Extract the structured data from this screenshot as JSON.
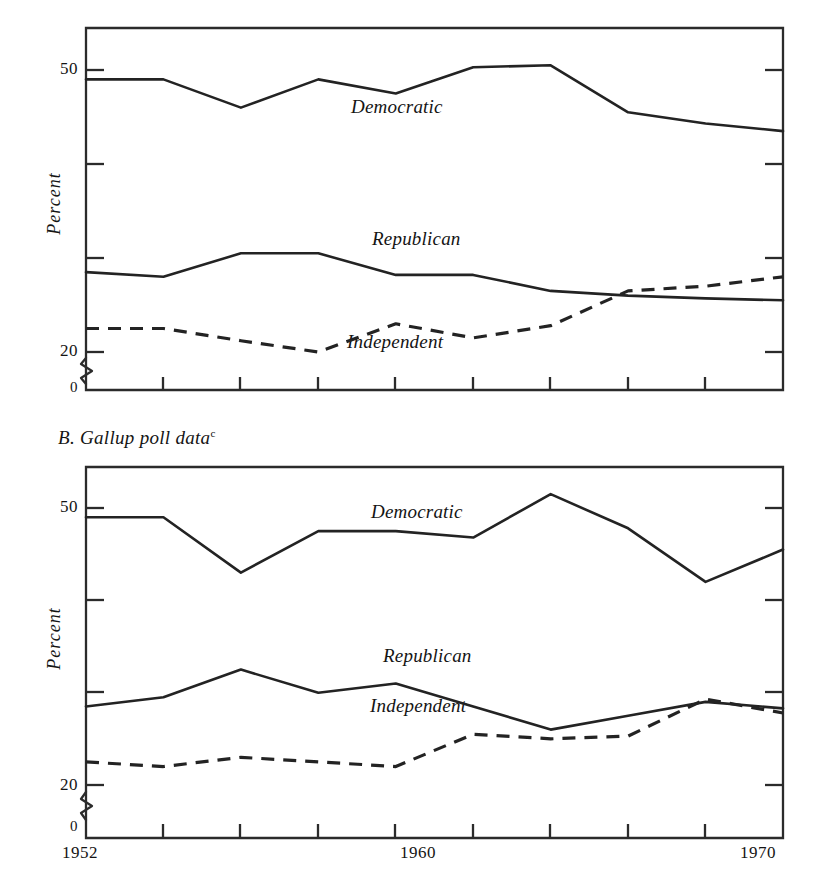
{
  "figure": {
    "panels": [
      {
        "id": "A",
        "caption": "",
        "caption_note": "",
        "ylabel": "Percent",
        "ytick_labels": [
          "50",
          "20",
          "0"
        ],
        "xtick_labels": [
          "",
          "",
          ""
        ]
      },
      {
        "id": "B",
        "caption": "B. Gallup poll data",
        "caption_note": "c",
        "ylabel": "Percent",
        "ytick_labels": [
          "50",
          "20",
          "0"
        ],
        "xtick_labels": [
          "1952",
          "1960",
          "1970"
        ]
      }
    ],
    "series_labels": {
      "democratic": "Democratic",
      "republican": "Republican",
      "independent": "Independent"
    },
    "colors": {
      "ink": "#232323",
      "paper": "#ffffff"
    }
  },
  "chart_data": [
    {
      "type": "line",
      "panel": "A",
      "title": "",
      "xlabel": "",
      "ylabel": "Percent",
      "x": [
        1952,
        1954,
        1956,
        1958,
        1960,
        1962,
        1964,
        1966,
        1968,
        1970
      ],
      "xlim": [
        1952,
        1970
      ],
      "ylim": [
        20,
        55
      ],
      "y_axis_break": true,
      "y_axis_break_to": 0,
      "grid": false,
      "legend_position": "inline-labels",
      "yticks": [
        20,
        30,
        40,
        50
      ],
      "ytick_labels_shown": [
        "20",
        "50"
      ],
      "series": [
        {
          "name": "Democratic",
          "style": "solid",
          "values": [
            49.0,
            49.0,
            46.0,
            49.0,
            47.5,
            50.3,
            50.5,
            45.5,
            44.3,
            43.5
          ]
        },
        {
          "name": "Republican",
          "style": "solid",
          "values": [
            28.5,
            28.0,
            30.5,
            30.5,
            28.2,
            28.2,
            26.5,
            26.0,
            25.7,
            25.5
          ]
        },
        {
          "name": "Independent",
          "style": "dashed",
          "values": [
            22.5,
            22.5,
            21.2,
            20.0,
            23.0,
            21.5,
            22.8,
            26.5,
            27.0,
            28.0
          ]
        }
      ]
    },
    {
      "type": "line",
      "panel": "B",
      "title": "B. Gallup poll data",
      "xlabel": "",
      "ylabel": "Percent",
      "x": [
        1952,
        1954,
        1956,
        1958,
        1960,
        1962,
        1964,
        1966,
        1968,
        1970
      ],
      "xlim": [
        1952,
        1970
      ],
      "ylim": [
        20,
        55
      ],
      "y_axis_break": true,
      "y_axis_break_to": 0,
      "grid": false,
      "legend_position": "inline-labels",
      "yticks": [
        20,
        30,
        40,
        50
      ],
      "ytick_labels_shown": [
        "20",
        "50"
      ],
      "series": [
        {
          "name": "Democratic",
          "style": "solid",
          "values": [
            49.0,
            49.0,
            43.0,
            47.5,
            47.5,
            46.8,
            51.5,
            47.8,
            42.0,
            45.5
          ]
        },
        {
          "name": "Republican",
          "style": "solid",
          "values": [
            28.5,
            29.5,
            32.5,
            30.0,
            31.0,
            28.5,
            26.0,
            27.5,
            29.0,
            28.3
          ]
        },
        {
          "name": "Independent",
          "style": "dashed",
          "values": [
            22.5,
            22.0,
            23.0,
            22.5,
            22.0,
            25.5,
            25.0,
            25.3,
            29.3,
            27.8
          ]
        }
      ]
    }
  ]
}
